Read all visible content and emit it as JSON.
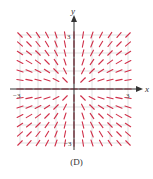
{
  "figure": {
    "caption": "(D)",
    "type": "slope_field",
    "x_axis_label": "x",
    "y_axis_label": "y",
    "ticks": {
      "x_min_label": "−3",
      "x_max_label": "3",
      "y_max_label": "3",
      "y_min_label": "−3"
    },
    "range": {
      "xmin": -3,
      "xmax": 3,
      "ymin": -3,
      "ymax": 3
    },
    "grid_step": 1,
    "segment_step": 0.5,
    "slope_rule": "sign(x*y) pattern: flat along x-axis, near-vertical along y-axis (dy/dx ≈ y/x)",
    "colors": {
      "segment": "#d0304a",
      "grid": "#cccccc",
      "axis": "#333333",
      "text": "#333333"
    }
  },
  "chart_data": {
    "type": "slope_field",
    "title": "(D)",
    "xlabel": "x",
    "ylabel": "y",
    "xlim": [
      -3,
      3
    ],
    "ylim": [
      -3,
      3
    ],
    "grid": true,
    "tick_labels": {
      "x": [
        "-3",
        "3"
      ],
      "y": [
        "-3",
        "3"
      ]
    },
    "field": "dy/dx = y/x",
    "quadrant_slopes": {
      "x<0,y>0": "negative",
      "x>0,y>0": "positive",
      "x<0,y<0": "positive",
      "x>0,y<0": "negative"
    }
  }
}
